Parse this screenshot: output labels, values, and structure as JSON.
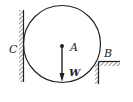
{
  "diagram": {
    "type": "statics free-body setup",
    "labels": {
      "wall": "C",
      "ledge": "B",
      "center": "A",
      "weight": "W"
    },
    "colors": {
      "stroke": "#222222",
      "background": "#ffffff"
    }
  }
}
